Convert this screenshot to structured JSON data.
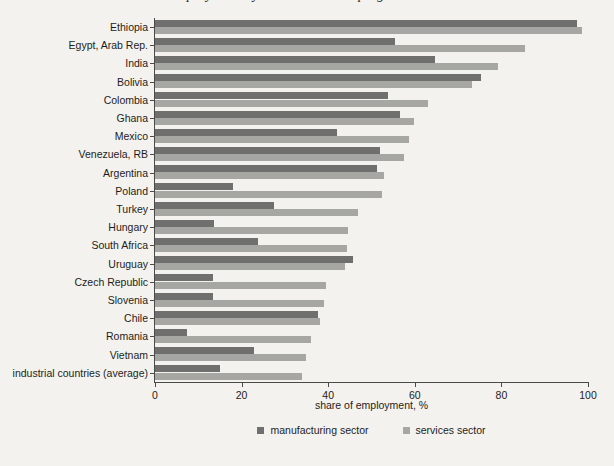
{
  "chart_data": {
    "type": "bar",
    "orientation": "horizontal",
    "title": "",
    "xlabel": "share of employment, %",
    "ylabel": "",
    "xlim": [
      0,
      100
    ],
    "xticks": [
      0,
      20,
      40,
      60,
      80,
      100
    ],
    "grid": false,
    "legend_position": "bottom-center",
    "categories": [
      "Ethiopia",
      "Egypt, Arab Rep.",
      "India",
      "Bolivia",
      "Colombia",
      "Ghana",
      "Mexico",
      "Venezuela, RB",
      "Argentina",
      "Poland",
      "Turkey",
      "Hungary",
      "South Africa",
      "Uruguay",
      "Czech Republic",
      "Slovenia",
      "Chile",
      "Romania",
      "Vietnam",
      "industrial countries (average)"
    ],
    "series": [
      {
        "name": "manufacturing sector",
        "color": "#6f6f6d",
        "values": [
          97.5,
          55.4,
          64.7,
          75.3,
          53.8,
          56.6,
          42.0,
          52.0,
          51.3,
          18.0,
          27.5,
          13.6,
          23.8,
          45.7,
          13.4,
          13.4,
          37.6,
          7.4,
          22.9,
          15.0
        ]
      },
      {
        "name": "services sector",
        "color": "#a6a6a2",
        "values": [
          98.6,
          85.5,
          79.2,
          73.2,
          63.0,
          59.8,
          58.7,
          57.5,
          52.9,
          52.4,
          46.9,
          44.6,
          44.3,
          43.9,
          39.5,
          39.0,
          38.1,
          36.0,
          34.9,
          34.0
        ]
      }
    ]
  },
  "axis": {
    "tick_labels": [
      "0",
      "20",
      "40",
      "60",
      "80",
      "100"
    ]
  },
  "legend": {
    "items": [
      {
        "label": "manufacturing sector"
      },
      {
        "label": "services sector"
      }
    ]
  },
  "title_fragment": "employment by sector in developing countries"
}
